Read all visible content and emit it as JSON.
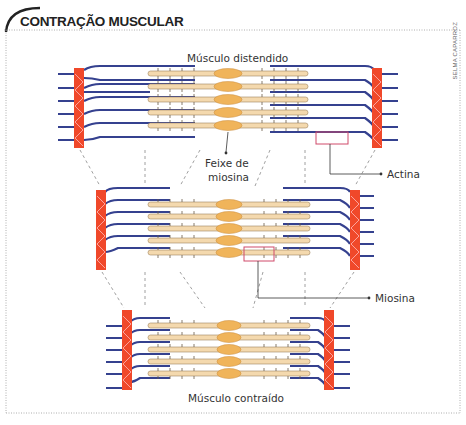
{
  "title": "CONTRAÇÃO MUSCULAR",
  "credit": "SELMA CAPARROZ",
  "labels": {
    "stretched": "Músculo distendido",
    "myosin_bundle_line1": "Feixe de",
    "myosin_bundle_line2": "miosina",
    "actin": "Actina",
    "myosin": "Miosina",
    "contracted": "Músculo contraído"
  },
  "colors": {
    "z_band": "#f0482a",
    "actin": "#35418f",
    "myosin": "#f4d9ae",
    "myosin_center": "#f0b45a",
    "highlight_box": "#d04a6a",
    "frame": "#999999"
  },
  "sarcomeres": [
    {
      "name": "stretched",
      "left_z": 78,
      "right_z": 376,
      "top": 66,
      "bottom": 148
    },
    {
      "name": "intermediate",
      "left_z": 100,
      "right_z": 354,
      "top": 188,
      "bottom": 270
    },
    {
      "name": "contracted",
      "left_z": 126,
      "right_z": 328,
      "top": 310,
      "bottom": 390
    }
  ]
}
